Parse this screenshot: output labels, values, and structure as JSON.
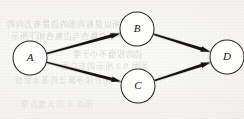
{
  "figure": {
    "kind": "directed-graph",
    "background_color": "#f4f3f1",
    "ink_color": "#141310",
    "node_fill_color": "#fdfdfc",
    "node_stroke_color": "#2b2a28"
  },
  "nodes": [
    {
      "id": "A",
      "label": "A",
      "cx": 30,
      "cy": 58,
      "r": 17
    },
    {
      "id": "B",
      "label": "B",
      "cx": 137,
      "cy": 29,
      "r": 17
    },
    {
      "id": "C",
      "label": "C",
      "cx": 138,
      "cy": 86,
      "r": 17
    },
    {
      "id": "D",
      "label": "D",
      "cx": 227,
      "cy": 57,
      "r": 17
    }
  ],
  "edges": [
    {
      "id": "A-B",
      "from": "A",
      "to": "B",
      "directed": true,
      "arrowhead": "solid"
    },
    {
      "id": "A-C",
      "from": "A",
      "to": "C",
      "directed": true,
      "arrowhead": "solid"
    },
    {
      "id": "B-D",
      "from": "B",
      "to": "D",
      "directed": true,
      "arrowhead": "solid"
    },
    {
      "id": "C-D",
      "from": "C",
      "to": "D",
      "directed": true,
      "arrowhead": "solid"
    }
  ],
  "ghost_text": {
    "line_1": "所以说有向图的边是有方向的",
    "line_2": "其中顶点集合与边集合如下所示",
    "line_3": "边的权值不小于零",
    "line_4": "如图 9.3 所示的有向图",
    "line_5": "拓扑排序算法的基本思想",
    "line_6": "顶点 A 的入度为零"
  }
}
